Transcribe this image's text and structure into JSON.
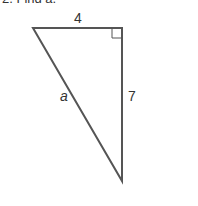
{
  "heading": "2. Find a.",
  "figure": {
    "top_label": "4",
    "right_label": "7",
    "hypotenuse_label": "a",
    "line_color": "#555555"
  }
}
